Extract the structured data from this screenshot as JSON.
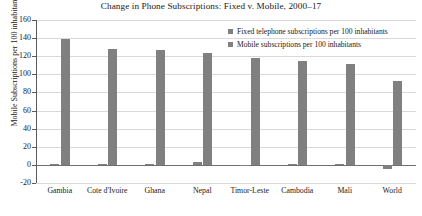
{
  "chart_data": {
    "type": "bar",
    "title": "Change in Phone Subscriptions: Fixed v. Mobile, 2000–17",
    "xlabel": "",
    "ylabel": "Mobile Subscriptions per 100 inhabitants",
    "ylim": [
      -20,
      160
    ],
    "ytick_step": 20,
    "yticks": [
      160,
      140,
      120,
      100,
      80,
      60,
      40,
      20,
      0,
      -20
    ],
    "ytick_labels": [
      "160",
      "140",
      "120",
      "100",
      "80",
      "60",
      "40",
      "20",
      "0",
      "-20"
    ],
    "grid": true,
    "legend_position": "top-right",
    "categories": [
      "Gambia",
      "Cote d'Ivoire",
      "Ghana",
      "Nepal",
      "Timor-Leste",
      "Cambodia",
      "Mali",
      "World"
    ],
    "series": [
      {
        "name": "Fixed telephone subscriptions per 100 inhabitants",
        "color": "#808080",
        "values": [
          0.5,
          0.5,
          0.5,
          3,
          0.3,
          0.5,
          0.5,
          -5
        ]
      },
      {
        "name": "Mobile subscriptions per 100 inhabitants",
        "color": "#808080",
        "values": [
          139,
          128,
          127,
          124,
          118,
          115,
          111,
          93
        ]
      }
    ]
  },
  "legend": {
    "entries": [
      {
        "label": "Fixed telephone subscriptions per 100 inhabitants",
        "swatch": "legend-swatch-fixed"
      },
      {
        "label": "Mobile subscriptions per 100 inhabitants",
        "swatch": "legend-swatch-mobile"
      }
    ]
  },
  "colors": {
    "bar": "#808080",
    "gridline": "#d9d9d9",
    "axis": "#5a5a5a",
    "zero_line": "#6f6f6f",
    "text": "#1a1a1a",
    "background": "#ffffff"
  }
}
